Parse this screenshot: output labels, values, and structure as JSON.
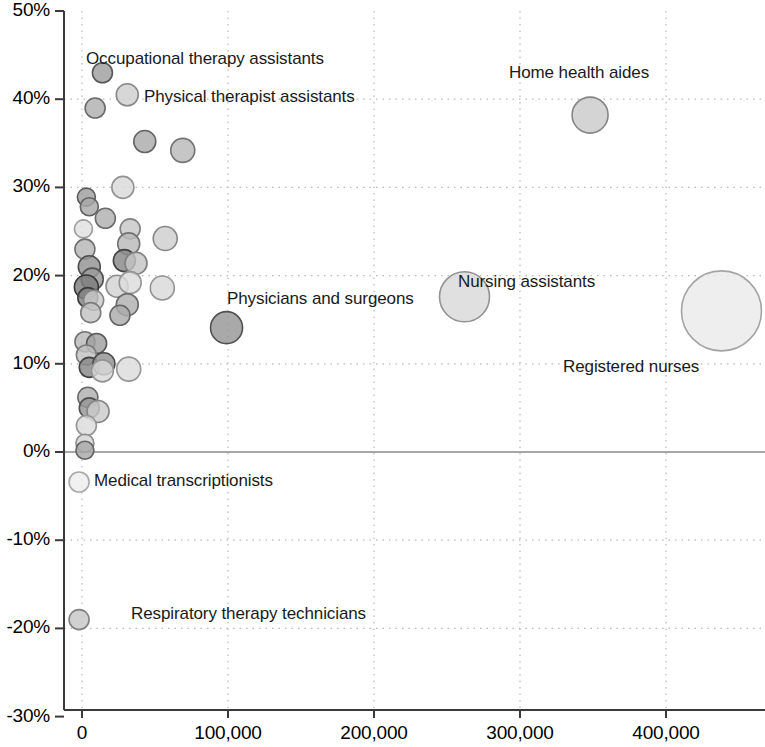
{
  "chart_data": {
    "type": "scatter",
    "title": "",
    "subtitle": "",
    "xlabel": "",
    "ylabel": "",
    "xlim": [
      -15000,
      472000
    ],
    "ylim": [
      -30,
      50
    ],
    "grid": true,
    "legend": null,
    "x_tick_labels": [
      "0",
      "100,000",
      "200,000",
      "300,000",
      "400,000"
    ],
    "x_ticks": [
      0,
      100000,
      200000,
      300000,
      400000
    ],
    "y_tick_labels": [
      "50%",
      "40%",
      "30%",
      "20%",
      "10%",
      "0%",
      "-10%",
      "-20%",
      "-30%"
    ],
    "y_ticks": [
      50,
      40,
      30,
      20,
      10,
      0,
      -10,
      -20,
      -30
    ],
    "zero_line": 0,
    "bubble_size_meaning": "employment size",
    "annotations": [
      {
        "text": "Occupational therapy assistants",
        "x_px": 86,
        "y_px": 49
      },
      {
        "text": "Physical therapist assistants",
        "x_px": 144,
        "y_px": 87
      },
      {
        "text": "Home health aides",
        "x_px": 509,
        "y_px": 63
      },
      {
        "text": "Nursing assistants",
        "x_px": 458,
        "y_px": 272
      },
      {
        "text": "Physicians and surgeons",
        "x_px": 227,
        "y_px": 289
      },
      {
        "text": "Registered nurses",
        "x_px": 563,
        "y_px": 357
      },
      {
        "text": "Medical transcriptionists",
        "x_px": 94,
        "y_px": 471
      },
      {
        "text": "Respiratory therapy technicians",
        "x_px": 131,
        "y_px": 604
      }
    ],
    "points": [
      {
        "name": "Occupational therapy assistants",
        "x": 14000,
        "y": 43.0,
        "r": 10,
        "shade": 0.55
      },
      {
        "name": "Physical therapist assistants",
        "x": 31000,
        "y": 40.5,
        "r": 11,
        "shade": 0.28
      },
      {
        "name": "Unlabeled",
        "x": 9000,
        "y": 39.0,
        "r": 10,
        "shade": 0.45
      },
      {
        "name": "Unlabeled",
        "x": 43000,
        "y": 35.2,
        "r": 11,
        "shade": 0.48
      },
      {
        "name": "Unlabeled",
        "x": 69000,
        "y": 34.2,
        "r": 12,
        "shade": 0.4
      },
      {
        "name": "Unlabeled",
        "x": 28000,
        "y": 30.0,
        "r": 11,
        "shade": 0.22
      },
      {
        "name": "Unlabeled",
        "x": 3000,
        "y": 28.9,
        "r": 9,
        "shade": 0.55
      },
      {
        "name": "Unlabeled",
        "x": 5000,
        "y": 27.8,
        "r": 9,
        "shade": 0.5
      },
      {
        "name": "Unlabeled",
        "x": 16000,
        "y": 26.5,
        "r": 10,
        "shade": 0.45
      },
      {
        "name": "Unlabeled",
        "x": 1000,
        "y": 25.3,
        "r": 9,
        "shade": 0.17
      },
      {
        "name": "Unlabeled",
        "x": 33000,
        "y": 25.3,
        "r": 10,
        "shade": 0.32
      },
      {
        "name": "Unlabeled",
        "x": 32000,
        "y": 23.6,
        "r": 11,
        "shade": 0.4
      },
      {
        "name": "Unlabeled",
        "x": 57000,
        "y": 24.2,
        "r": 12,
        "shade": 0.28
      },
      {
        "name": "Unlabeled",
        "x": 2000,
        "y": 23.0,
        "r": 10,
        "shade": 0.42
      },
      {
        "name": "Unlabeled",
        "x": 5000,
        "y": 21.0,
        "r": 11,
        "shade": 0.62
      },
      {
        "name": "Unlabeled",
        "x": 29000,
        "y": 21.7,
        "r": 11,
        "shade": 0.68
      },
      {
        "name": "Unlabeled",
        "x": 37000,
        "y": 21.4,
        "r": 11,
        "shade": 0.33
      },
      {
        "name": "Unlabeled",
        "x": 7000,
        "y": 19.6,
        "r": 11,
        "shade": 0.58
      },
      {
        "name": "Unlabeled",
        "x": 3000,
        "y": 18.7,
        "r": 12,
        "shade": 0.75
      },
      {
        "name": "Unlabeled",
        "x": 24000,
        "y": 18.8,
        "r": 11,
        "shade": 0.25
      },
      {
        "name": "Unlabeled",
        "x": 33000,
        "y": 19.2,
        "r": 11,
        "shade": 0.2
      },
      {
        "name": "Unlabeled",
        "x": 55000,
        "y": 18.6,
        "r": 12,
        "shade": 0.22
      },
      {
        "name": "Unlabeled",
        "x": 4000,
        "y": 17.5,
        "r": 10,
        "shade": 0.72
      },
      {
        "name": "Unlabeled",
        "x": 8000,
        "y": 17.2,
        "r": 10,
        "shade": 0.3
      },
      {
        "name": "Unlabeled",
        "x": 31000,
        "y": 16.7,
        "r": 11,
        "shade": 0.45
      },
      {
        "name": "Unlabeled",
        "x": 6000,
        "y": 15.8,
        "r": 10,
        "shade": 0.35
      },
      {
        "name": "Unlabeled",
        "x": 26000,
        "y": 15.5,
        "r": 10,
        "shade": 0.48
      },
      {
        "name": "Physicians and surgeons",
        "x": 99000,
        "y": 14.1,
        "r": 16,
        "shade": 0.6
      },
      {
        "name": "Unlabeled",
        "x": 2000,
        "y": 12.5,
        "r": 10,
        "shade": 0.4
      },
      {
        "name": "Unlabeled",
        "x": 10000,
        "y": 12.3,
        "r": 10,
        "shade": 0.55
      },
      {
        "name": "Unlabeled",
        "x": 3000,
        "y": 11.0,
        "r": 10,
        "shade": 0.35
      },
      {
        "name": "Unlabeled",
        "x": 5000,
        "y": 9.6,
        "r": 10,
        "shade": 0.68
      },
      {
        "name": "Unlabeled",
        "x": 15000,
        "y": 10.0,
        "r": 11,
        "shade": 0.62
      },
      {
        "name": "Unlabeled",
        "x": 14000,
        "y": 9.2,
        "r": 11,
        "shade": 0.22
      },
      {
        "name": "Unlabeled",
        "x": 32000,
        "y": 9.4,
        "r": 12,
        "shade": 0.2
      },
      {
        "name": "Unlabeled",
        "x": 4000,
        "y": 6.2,
        "r": 10,
        "shade": 0.45
      },
      {
        "name": "Unlabeled",
        "x": 5000,
        "y": 5.0,
        "r": 10,
        "shade": 0.6
      },
      {
        "name": "Unlabeled",
        "x": 11000,
        "y": 4.6,
        "r": 11,
        "shade": 0.3
      },
      {
        "name": "Unlabeled",
        "x": 3000,
        "y": 3.0,
        "r": 10,
        "shade": 0.2
      },
      {
        "name": "Unlabeled",
        "x": 2000,
        "y": 1.0,
        "r": 9,
        "shade": 0.25
      },
      {
        "name": "Unlabeled",
        "x": 2000,
        "y": 0.2,
        "r": 9,
        "shade": 0.5
      },
      {
        "name": "Nursing assistants",
        "x": 262000,
        "y": 17.6,
        "r": 25,
        "shade": 0.22
      },
      {
        "name": "Registered nurses",
        "x": 438000,
        "y": 16.0,
        "r": 40,
        "shade": 0.12
      },
      {
        "name": "Home health aides",
        "x": 348000,
        "y": 38.2,
        "r": 18,
        "shade": 0.3
      },
      {
        "name": "Medical transcriptionists",
        "x": -2000,
        "y": -3.4,
        "r": 10,
        "shade": 0.1
      },
      {
        "name": "Respiratory therapy technicians",
        "x": -2000,
        "y": -19.0,
        "r": 10,
        "shade": 0.32
      }
    ]
  },
  "axes": {
    "x_origin_px": 82,
    "x_scale_px_per_unit": 0.00146,
    "y_zero_px": 452,
    "y_scale_px_per_pct": 8.82
  }
}
